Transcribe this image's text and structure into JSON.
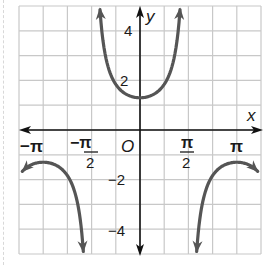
{
  "chart_data": {
    "type": "line",
    "title": "",
    "function": "y = 1.3 sec x",
    "xlabel": "x",
    "ylabel": "y",
    "origin_label": "O",
    "xlim": [
      -3.927,
      3.927
    ],
    "ylim": [
      -5,
      5
    ],
    "grid": true,
    "x_grid_step": "π/4",
    "y_grid_step": 1,
    "x_ticks": [
      {
        "value": -3.1416,
        "label": "−π"
      },
      {
        "value": -1.5708,
        "label_num": "−π",
        "label_den": "2"
      },
      {
        "value": 1.5708,
        "label_num": "π",
        "label_den": "2"
      },
      {
        "value": 3.1416,
        "label": "π"
      }
    ],
    "y_ticks": [
      {
        "value": 4,
        "label": "4"
      },
      {
        "value": 2,
        "label": "2"
      },
      {
        "value": -2,
        "label": "−2"
      },
      {
        "value": -4,
        "label": "−4"
      }
    ],
    "series": [
      {
        "name": "upper branch",
        "x": [
          -1.296,
          -1.2,
          -1.0,
          -0.8,
          -0.6,
          -0.4,
          -0.2,
          0,
          0.2,
          0.4,
          0.6,
          0.8,
          1.0,
          1.2,
          1.296
        ],
        "y": [
          4.8,
          3.6,
          2.41,
          1.87,
          1.58,
          1.41,
          1.33,
          1.3,
          1.33,
          1.41,
          1.58,
          1.87,
          2.41,
          3.6,
          4.8
        ]
      },
      {
        "name": "left lower branch",
        "x": [
          -3.8,
          -3.5,
          -3.1416,
          -2.8,
          -2.5,
          -2.2,
          -2.0,
          -1.84
        ],
        "y": [
          -1.65,
          -1.39,
          -1.3,
          -1.38,
          -1.62,
          -2.18,
          -3.12,
          -4.9
        ]
      },
      {
        "name": "right lower branch",
        "x": [
          1.84,
          2.0,
          2.2,
          2.5,
          2.8,
          3.1416,
          3.5,
          3.8
        ],
        "y": [
          -4.9,
          -3.12,
          -2.18,
          -1.62,
          -1.38,
          -1.3,
          -1.39,
          -1.65
        ]
      }
    ],
    "curve_color": "#555555",
    "axis_color": "#111111",
    "grid_color": "#c8c8c8"
  },
  "labels": {
    "x_axis": "x",
    "y_axis": "y",
    "origin": "O",
    "neg_pi": "−π",
    "neg_pi_half_num": "−π",
    "pi_half_num": "π",
    "half_den": "2",
    "pi": "π",
    "y4": "4",
    "y2": "2",
    "yneg2": "−2",
    "yneg4": "−4"
  }
}
